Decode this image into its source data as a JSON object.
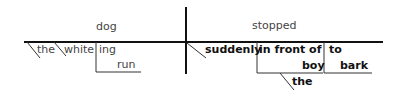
{
  "diagram": {
    "type": "sentence-diagram",
    "sentence_parts": {
      "subject": "dog",
      "predicate": "stopped",
      "subject_modifiers": [
        "the",
        "white"
      ],
      "participle_phrase": {
        "suffix": "ing",
        "verb": "run"
      },
      "adverb": "suddenly",
      "prepositional_phrase": {
        "preposition": "in front of",
        "object": "boy",
        "object_modifier": "the"
      },
      "infinitive_phrase": {
        "marker": "to",
        "verb": "bark"
      }
    },
    "colors": {
      "line": "#111111",
      "light_text": "#444444",
      "bold_text": "#111111"
    }
  }
}
